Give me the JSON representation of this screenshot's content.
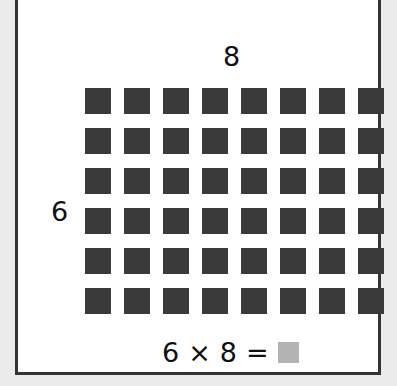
{
  "diagram": {
    "type": "array-multiplication",
    "columns_label": "8",
    "rows_label": "6",
    "rows": 6,
    "columns": 8,
    "square_color": "#3a3a3a",
    "equation": {
      "left": "6",
      "operator": "×",
      "right": "8",
      "equals": "=",
      "answer_placeholder_color": "#b3b3b3"
    }
  }
}
